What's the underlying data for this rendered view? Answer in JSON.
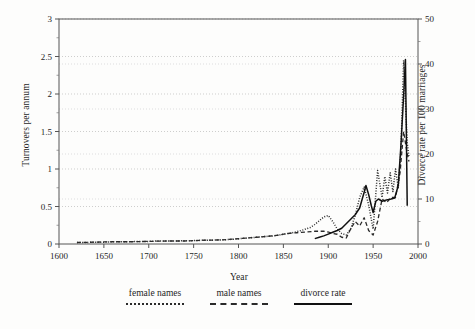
{
  "chart_data": {
    "type": "line",
    "title": "",
    "xlabel": "Year",
    "ylabel": "Turnovers per annum",
    "ylabel_right": "Divorce rate per 100 marriages",
    "xlim": [
      1600,
      2000
    ],
    "ylim": [
      0,
      3
    ],
    "ylim_right": [
      0,
      50
    ],
    "xticks": [
      1600,
      1650,
      1700,
      1750,
      1800,
      1850,
      1900,
      1950,
      2000
    ],
    "yticks_left": [
      0,
      0.5,
      1,
      1.5,
      2,
      2.5,
      3
    ],
    "yticks_right": [
      0,
      10,
      20,
      30,
      40,
      50
    ],
    "grid": "horizontal-dotted",
    "legend_position": "below-axes",
    "series": [
      {
        "name": "female names",
        "style": "dotted",
        "axis": "left",
        "x": [
          1620,
          1630,
          1640,
          1650,
          1660,
          1670,
          1680,
          1690,
          1700,
          1710,
          1720,
          1730,
          1740,
          1750,
          1760,
          1770,
          1780,
          1790,
          1800,
          1810,
          1820,
          1830,
          1840,
          1850,
          1860,
          1870,
          1875,
          1880,
          1885,
          1890,
          1895,
          1900,
          1905,
          1910,
          1915,
          1920,
          1925,
          1930,
          1935,
          1940,
          1945,
          1950,
          1955,
          1960,
          1963,
          1966,
          1969,
          1972,
          1975,
          1978,
          1981,
          1984,
          1986,
          1988,
          1990
        ],
        "values": [
          0.02,
          0.02,
          0.025,
          0.025,
          0.03,
          0.03,
          0.03,
          0.035,
          0.035,
          0.04,
          0.04,
          0.04,
          0.045,
          0.045,
          0.05,
          0.05,
          0.055,
          0.06,
          0.07,
          0.08,
          0.09,
          0.1,
          0.11,
          0.13,
          0.15,
          0.18,
          0.2,
          0.22,
          0.26,
          0.31,
          0.36,
          0.38,
          0.3,
          0.2,
          0.14,
          0.12,
          0.2,
          0.38,
          0.62,
          0.76,
          0.52,
          0.2,
          0.98,
          0.62,
          0.9,
          0.68,
          0.95,
          0.7,
          1.0,
          0.75,
          1.25,
          2.45,
          1.9,
          1.35,
          1.15
        ]
      },
      {
        "name": "male names",
        "style": "dashed",
        "axis": "left",
        "x": [
          1620,
          1640,
          1660,
          1680,
          1700,
          1720,
          1740,
          1760,
          1780,
          1800,
          1820,
          1840,
          1855,
          1865,
          1875,
          1885,
          1895,
          1900,
          1905,
          1910,
          1915,
          1920,
          1925,
          1930,
          1935,
          1940,
          1945,
          1950,
          1955,
          1960,
          1965,
          1970,
          1975,
          1980,
          1984,
          1988,
          1990
        ],
        "values": [
          0.02,
          0.025,
          0.03,
          0.03,
          0.035,
          0.04,
          0.04,
          0.05,
          0.055,
          0.07,
          0.09,
          0.11,
          0.14,
          0.15,
          0.16,
          0.17,
          0.17,
          0.16,
          0.14,
          0.13,
          0.09,
          0.08,
          0.2,
          0.3,
          0.24,
          0.35,
          0.18,
          0.12,
          0.3,
          0.6,
          0.55,
          0.62,
          0.62,
          0.95,
          1.5,
          1.2,
          1.1
        ]
      },
      {
        "name": "divorce rate",
        "style": "solid",
        "axis": "right",
        "x": [
          1885,
          1890,
          1895,
          1900,
          1905,
          1910,
          1915,
          1920,
          1925,
          1930,
          1935,
          1940,
          1942,
          1945,
          1948,
          1950,
          1953,
          1956,
          1960,
          1965,
          1970,
          1974,
          1978,
          1981,
          1984,
          1986,
          1988
        ],
        "values": [
          1.2,
          1.5,
          1.8,
          2.2,
          2.6,
          3.0,
          3.5,
          4.5,
          5.5,
          6.5,
          8.0,
          11.5,
          13.0,
          11.0,
          8.5,
          7.0,
          9.5,
          10.0,
          9.5,
          9.8,
          10.0,
          10.2,
          13.0,
          22.0,
          33.0,
          41.0,
          8.5
        ]
      }
    ]
  },
  "legend": {
    "items": [
      {
        "label": "female names",
        "style": "dotted"
      },
      {
        "label": "male names",
        "style": "dashed"
      },
      {
        "label": "divorce rate",
        "style": "solid"
      }
    ]
  }
}
